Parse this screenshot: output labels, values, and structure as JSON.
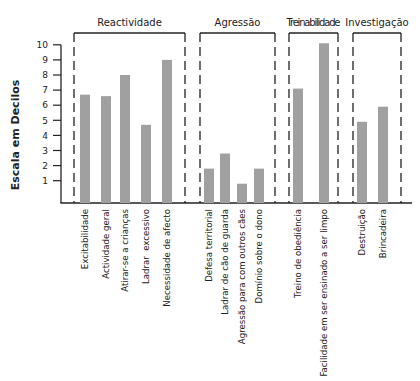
{
  "chart_data": {
    "type": "bar",
    "title": "",
    "xlabel": "",
    "ylabel": "Escala em Decilos",
    "ylim": [
      0,
      10
    ],
    "yticks": [
      1,
      2,
      3,
      4,
      5,
      6,
      7,
      8,
      9,
      10
    ],
    "grid": false,
    "bar_color": "#a0a0a0",
    "groups": [
      {
        "name": "Reactividade",
        "categories": [
          "Excitabilidade",
          "Actividade geral",
          "Atirar-se a crianças",
          "Ladrar  excessivo",
          "Necessidade de afecto"
        ],
        "values": [
          6.7,
          6.6,
          8.0,
          4.7,
          9.0
        ]
      },
      {
        "name": "Agressão",
        "categories": [
          "Defesa territorial",
          "Ladrar de cão de guarda",
          "Agressão para com outros cães",
          "Domínio sobre o dono"
        ],
        "values": [
          1.8,
          2.8,
          0.8,
          1.8
        ]
      },
      {
        "name": "Treinabilidade",
        "categories": [
          "Treino de obediência",
          "Facilidade em ser ensinado a ser limpo"
        ],
        "values": [
          7.1,
          10.1
        ]
      },
      {
        "name": "Investigação",
        "categories": [
          "Destruição",
          "Brincadeira"
        ],
        "values": [
          4.9,
          5.9
        ]
      }
    ]
  }
}
